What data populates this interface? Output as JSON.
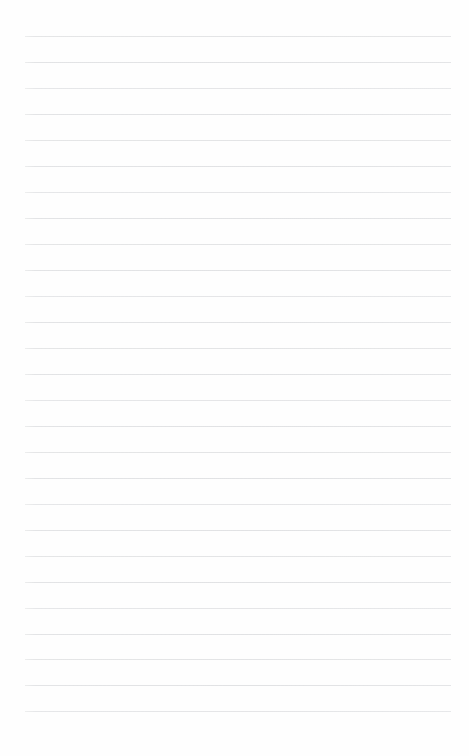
{
  "page": {
    "kind": "lined-paper",
    "width": 469,
    "height": 756,
    "background_color": "#fefefe",
    "content_text": ""
  },
  "ruling": {
    "line_color": "#e2e3e5",
    "line_thickness": 1,
    "line_count": 27,
    "first_line_y": 36,
    "line_spacing": 26,
    "left_margin_x": 25,
    "right_end_x": 451,
    "line_width": 426,
    "lines": [
      {
        "index": 1,
        "y": 36,
        "x": 25,
        "width": 426
      },
      {
        "index": 2,
        "y": 62,
        "x": 25,
        "width": 426
      },
      {
        "index": 3,
        "y": 88,
        "x": 25,
        "width": 426
      },
      {
        "index": 4,
        "y": 114,
        "x": 25,
        "width": 426
      },
      {
        "index": 5,
        "y": 140,
        "x": 25,
        "width": 426
      },
      {
        "index": 6,
        "y": 166,
        "x": 25,
        "width": 426
      },
      {
        "index": 7,
        "y": 192,
        "x": 25,
        "width": 426
      },
      {
        "index": 8,
        "y": 218,
        "x": 25,
        "width": 426
      },
      {
        "index": 9,
        "y": 244,
        "x": 25,
        "width": 426
      },
      {
        "index": 10,
        "y": 270,
        "x": 25,
        "width": 426
      },
      {
        "index": 11,
        "y": 296,
        "x": 25,
        "width": 426
      },
      {
        "index": 12,
        "y": 322,
        "x": 25,
        "width": 426
      },
      {
        "index": 13,
        "y": 348,
        "x": 25,
        "width": 426
      },
      {
        "index": 14,
        "y": 374,
        "x": 25,
        "width": 426
      },
      {
        "index": 15,
        "y": 400,
        "x": 25,
        "width": 426
      },
      {
        "index": 16,
        "y": 426,
        "x": 25,
        "width": 426
      },
      {
        "index": 17,
        "y": 452,
        "x": 25,
        "width": 426
      },
      {
        "index": 18,
        "y": 478,
        "x": 25,
        "width": 426
      },
      {
        "index": 19,
        "y": 504,
        "x": 25,
        "width": 426
      },
      {
        "index": 20,
        "y": 530,
        "x": 25,
        "width": 426
      },
      {
        "index": 21,
        "y": 556,
        "x": 25,
        "width": 426
      },
      {
        "index": 22,
        "y": 582,
        "x": 25,
        "width": 426
      },
      {
        "index": 23,
        "y": 608,
        "x": 25,
        "width": 426
      },
      {
        "index": 24,
        "y": 634,
        "x": 25,
        "width": 426
      },
      {
        "index": 25,
        "y": 659,
        "x": 25,
        "width": 426
      },
      {
        "index": 26,
        "y": 685,
        "x": 25,
        "width": 426
      },
      {
        "index": 27,
        "y": 711,
        "x": 25,
        "width": 426
      }
    ]
  }
}
